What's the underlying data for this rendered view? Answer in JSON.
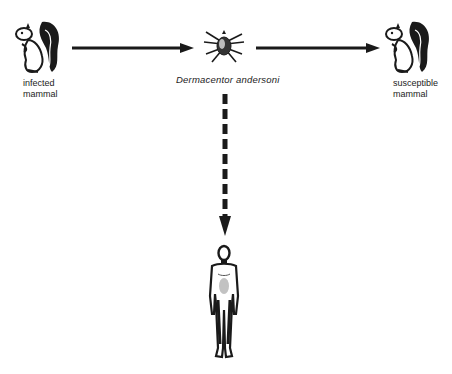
{
  "diagram": {
    "nodes": {
      "infected_mammal": {
        "label_line1": "infected",
        "label_line2": "mammal",
        "icon": "squirrel-icon"
      },
      "tick": {
        "label": "Dermacentor andersoni",
        "icon": "tick-icon"
      },
      "susceptible_mammal": {
        "label_line1": "susceptible",
        "label_line2": "mammal",
        "icon": "squirrel-icon"
      },
      "human": {
        "icon": "human-figure-icon"
      }
    },
    "edges": [
      {
        "from": "infected_mammal",
        "to": "tick",
        "style": "solid"
      },
      {
        "from": "tick",
        "to": "susceptible_mammal",
        "style": "solid"
      },
      {
        "from": "tick",
        "to": "human",
        "style": "dashed"
      }
    ],
    "colors": {
      "stroke": "#1a1a1a",
      "background": "#ffffff"
    }
  }
}
